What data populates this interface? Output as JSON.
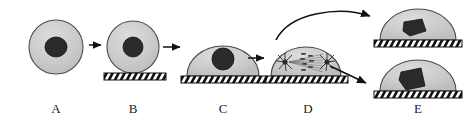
{
  "figure": {
    "background": "#ffffff",
    "width": 476,
    "height": 129
  },
  "palette": {
    "cell_fill": "#c9c9c9",
    "cell_fill_light": "#d4d4d4",
    "cell_outline": "#4a4a4a",
    "nucleus_fill": "#2b2b2b",
    "nucleus_outline": "#111111",
    "substrate_fill": "#ffffff",
    "substrate_outline": "#111111",
    "hatch_color": "#111111",
    "arrow_color": "#111111",
    "spindle_color": "#555555",
    "aster_color": "#2b2b2b",
    "label_color": "#1a1a1a"
  },
  "labels": [
    {
      "id": "A",
      "text": "A",
      "x": 56,
      "y": 108
    },
    {
      "id": "B",
      "text": "B",
      "x": 133,
      "y": 108
    },
    {
      "id": "C",
      "text": "C",
      "x": 223,
      "y": 108
    },
    {
      "id": "D",
      "text": "D",
      "x": 308,
      "y": 108
    },
    {
      "id": "E",
      "text": "E",
      "x": 418,
      "y": 108
    }
  ],
  "stages": [
    {
      "id": "A",
      "name": "round-detached-cell",
      "description": "Fully rounded cell in suspension, no substrate contact",
      "shape": "circle",
      "cell": {
        "cx": 56,
        "cy": 47,
        "rx": 27,
        "ry": 27
      },
      "nucleus": {
        "cx": 56,
        "cy": 47,
        "rx": 11,
        "ry": 10,
        "shape": "round"
      },
      "substrate": null
    },
    {
      "id": "B",
      "name": "attaching-round-cell",
      "description": "Rounded cell makes initial contact with the substrate",
      "shape": "circle",
      "cell": {
        "cx": 133,
        "cy": 47,
        "rx": 26,
        "ry": 26
      },
      "nucleus": {
        "cx": 133,
        "cy": 47,
        "rx": 10,
        "ry": 10,
        "shape": "round"
      },
      "substrate": {
        "x": 104,
        "y": 73,
        "width": 62,
        "height": 7
      }
    },
    {
      "id": "C",
      "name": "spread-cell",
      "description": "Cell flattens and spreads into a dome on the substrate",
      "shape": "dome",
      "cell": {
        "cx": 223,
        "cy": 76,
        "rx": 36,
        "ry": 30
      },
      "nucleus": {
        "cx": 223,
        "cy": 59,
        "rx": 11,
        "ry": 11,
        "shape": "round"
      },
      "substrate": {
        "x": 181,
        "y": 76,
        "width": 85,
        "height": 7
      }
    },
    {
      "id": "D",
      "name": "mitotic-cell",
      "description": "Cell enters mitosis: bipolar spindle with two asters and aligned chromosomes",
      "shape": "dome",
      "cell": {
        "cx": 306,
        "cy": 76,
        "rx": 35,
        "ry": 29
      },
      "nucleus": null,
      "spindle": {
        "asters": [
          {
            "cx": 285,
            "cy": 62,
            "r": 7
          },
          {
            "cx": 327,
            "cy": 62,
            "r": 7
          }
        ],
        "fiber_count": 9,
        "chromosome_rows": 5
      },
      "substrate": {
        "x": 266,
        "y": 76,
        "width": 82,
        "height": 7
      }
    },
    {
      "id": "E-upper",
      "name": "daughter-cell-upper",
      "description": "Upper daughter cell re-spread on substrate with irregular nucleus",
      "shape": "dome",
      "cell": {
        "cx": 418,
        "cy": 40,
        "rx": 38,
        "ry": 31
      },
      "nucleus": {
        "cx": 414,
        "cy": 27,
        "rx": 12,
        "ry": 9,
        "shape": "angular"
      },
      "substrate": {
        "x": 374,
        "y": 40,
        "width": 88,
        "height": 7
      }
    },
    {
      "id": "E-lower",
      "name": "daughter-cell-lower",
      "description": "Lower daughter cell re-spread on substrate with irregular nucleus",
      "shape": "dome",
      "cell": {
        "cx": 418,
        "cy": 91,
        "rx": 38,
        "ry": 31
      },
      "nucleus": {
        "cx": 412,
        "cy": 79,
        "rx": 12,
        "ry": 11,
        "shape": "angular"
      },
      "substrate": {
        "x": 374,
        "y": 91,
        "width": 88,
        "height": 7
      }
    }
  ],
  "arrows": [
    {
      "id": "a-to-b",
      "name": "arrow-a-to-b",
      "type": "straight",
      "x1": 89,
      "y1": 45,
      "x2": 103,
      "y2": 45
    },
    {
      "id": "b-to-c",
      "name": "arrow-b-to-c",
      "type": "straight",
      "x1": 163,
      "y1": 47,
      "x2": 182,
      "y2": 47
    },
    {
      "id": "c-to-d",
      "name": "arrow-c-to-d",
      "type": "straight",
      "x1": 248,
      "y1": 58,
      "x2": 266,
      "y2": 58
    },
    {
      "id": "d-to-e-upper",
      "name": "arrow-d-to-e-upper",
      "type": "curved",
      "x1": 276,
      "y1": 38,
      "cx": 330,
      "cy": 10,
      "x2": 372,
      "y2": 17
    },
    {
      "id": "d-to-e-lower",
      "name": "arrow-d-to-e-lower",
      "type": "straight",
      "x1": 330,
      "y1": 66,
      "x2": 368,
      "y2": 84
    }
  ]
}
